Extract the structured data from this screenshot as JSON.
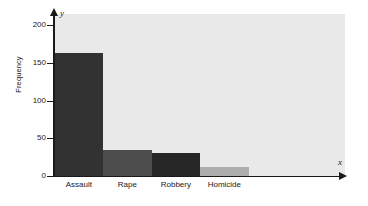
{
  "chart_data": {
    "type": "bar",
    "title": "",
    "subtitle": "",
    "xlabel": "",
    "ylabel": "Frequency",
    "xaxis_name": "x",
    "yaxis_name": "y",
    "categories": [
      "Assault",
      "Rape",
      "Robbery",
      "Homicide"
    ],
    "values": [
      163,
      35,
      31,
      12
    ],
    "series": [
      {
        "name": "Frequency",
        "values": [
          163,
          35,
          31,
          12
        ]
      }
    ],
    "ylim": [
      0,
      215
    ],
    "yticks": [
      0,
      50,
      100,
      150,
      200
    ],
    "ytick_labels": [
      "0",
      "50",
      "100",
      "150",
      "200"
    ],
    "grid": false,
    "legend": false,
    "legend_position": "none",
    "bar_colors": [
      "#323232",
      "#4d4d4d",
      "#262626",
      "#adadad"
    ],
    "plot_background": "#e9e9e9",
    "axis_color": "#1a1a1a",
    "figure_background": "#ffffff"
  }
}
